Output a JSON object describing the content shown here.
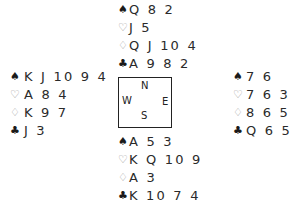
{
  "suit_symbols": {
    "spades": "♠",
    "hearts": "♡",
    "diamonds": "♢",
    "clubs": "♣"
  },
  "colors": {
    "black_suits": "#1a1a1a",
    "red_suits_outline": "#9a9a9a",
    "text": "#2a2a2a",
    "compass_border": "#222222"
  },
  "compass": {
    "north": "N",
    "south": "S",
    "west": "W",
    "east": "E"
  },
  "hands": {
    "north": {
      "spades": "Q 8 2",
      "hearts": "J 5",
      "diamonds": "Q J 10 4",
      "clubs": "A 9 8 2"
    },
    "west": {
      "spades": "K J 10 9 4",
      "hearts": "A 8 4",
      "diamonds": "K 9 7",
      "clubs": "J 3"
    },
    "east": {
      "spades": "7 6",
      "hearts": "7 6 3 2",
      "diamonds": "8 6 5 2",
      "clubs": "Q 6 5"
    },
    "south": {
      "spades": "A 5 3",
      "hearts": "K Q 10 9",
      "diamonds": "A 3",
      "clubs": "K 10 7 4"
    }
  }
}
